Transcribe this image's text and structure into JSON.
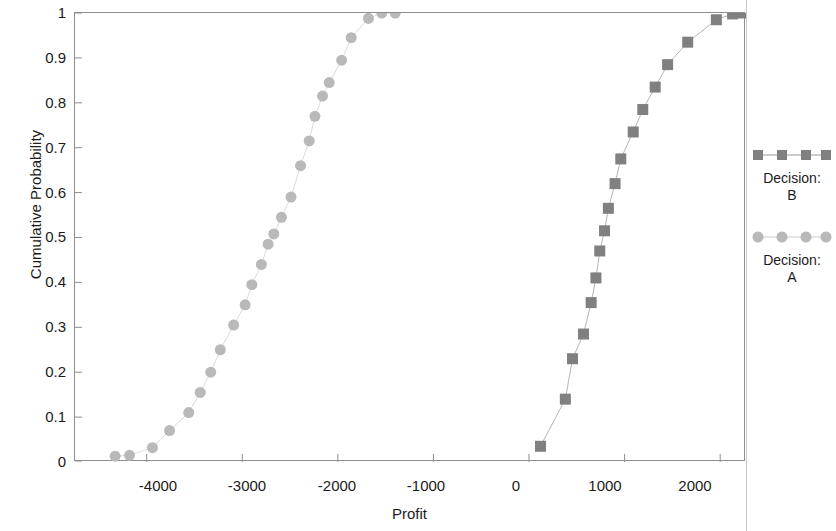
{
  "chart_data": {
    "type": "line",
    "title": "",
    "xlabel": "Profit",
    "ylabel": "Cumulative Probability",
    "xlim": [
      -4750,
      2270
    ],
    "ylim": [
      0,
      1
    ],
    "grid": false,
    "legend_position": "right",
    "xticks": [
      -4000,
      -3000,
      -2000,
      -1000,
      0,
      1000,
      2000
    ],
    "yticks": [
      0,
      0.1,
      0.2,
      0.3,
      0.4,
      0.5,
      0.6,
      0.7,
      0.8,
      0.9,
      1
    ],
    "series": [
      {
        "name": "Decision: B",
        "marker": "square",
        "color": "#808080",
        "points": [
          [
            120,
            0.035
          ],
          [
            380,
            0.14
          ],
          [
            455,
            0.23
          ],
          [
            570,
            0.285
          ],
          [
            650,
            0.355
          ],
          [
            700,
            0.41
          ],
          [
            740,
            0.47
          ],
          [
            790,
            0.515
          ],
          [
            830,
            0.565
          ],
          [
            900,
            0.62
          ],
          [
            960,
            0.675
          ],
          [
            1090,
            0.735
          ],
          [
            1190,
            0.785
          ],
          [
            1320,
            0.835
          ],
          [
            1450,
            0.885
          ],
          [
            1660,
            0.935
          ],
          [
            1960,
            0.985
          ],
          [
            2130,
            0.998
          ],
          [
            2230,
            1.0
          ]
        ]
      },
      {
        "name": "Decision: A",
        "marker": "circle",
        "color": "#b9b9b9",
        "points": [
          [
            -4330,
            0.013
          ],
          [
            -4180,
            0.015
          ],
          [
            -3940,
            0.032
          ],
          [
            -3760,
            0.07
          ],
          [
            -3560,
            0.11
          ],
          [
            -3440,
            0.155
          ],
          [
            -3330,
            0.2
          ],
          [
            -3230,
            0.25
          ],
          [
            -3090,
            0.305
          ],
          [
            -2970,
            0.35
          ],
          [
            -2900,
            0.395
          ],
          [
            -2800,
            0.44
          ],
          [
            -2730,
            0.485
          ],
          [
            -2670,
            0.508
          ],
          [
            -2590,
            0.545
          ],
          [
            -2490,
            0.59
          ],
          [
            -2390,
            0.66
          ],
          [
            -2300,
            0.715
          ],
          [
            -2240,
            0.77
          ],
          [
            -2160,
            0.815
          ],
          [
            -2090,
            0.845
          ],
          [
            -1960,
            0.895
          ],
          [
            -1860,
            0.945
          ],
          [
            -1680,
            0.988
          ],
          [
            -1540,
            1.0
          ],
          [
            -1400,
            1.0
          ]
        ]
      }
    ]
  },
  "axes": {
    "y_label": "Cumulative Probability",
    "x_label": "Profit",
    "y_ticks": [
      "1",
      "0.9",
      "0.8",
      "0.7",
      "0.6",
      "0.5",
      "0.4",
      "0.3",
      "0.2",
      "0.1",
      "0"
    ],
    "x_ticks": [
      "-4000",
      "-3000",
      "-2000",
      "-1000",
      "0",
      "1000",
      "2000"
    ]
  },
  "legend": {
    "entries": [
      {
        "line1": "Decision:",
        "line2": "B",
        "color": "#808080",
        "marker": "square"
      },
      {
        "line1": "Decision:",
        "line2": "A",
        "color": "#b9b9b9",
        "marker": "circle"
      }
    ]
  },
  "colors": {
    "series_b": "#808080",
    "series_a": "#b9b9b9",
    "frame": "#8e8e8e",
    "text": "#1b1b1b",
    "background": "#ffffff"
  }
}
